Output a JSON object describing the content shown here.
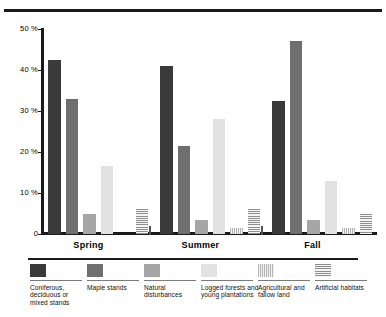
{
  "chart_data": {
    "type": "bar",
    "title": "",
    "xlabel": "",
    "ylabel": "",
    "ylim": [
      0,
      50
    ],
    "ytick_labels": [
      "50 %",
      "40 %",
      "30 %",
      "20 %",
      "10 %",
      "0"
    ],
    "ytick_values": [
      50,
      40,
      30,
      20,
      10,
      0
    ],
    "grid": false,
    "legend_position": "bottom",
    "categories": [
      "Spring",
      "Summer",
      "Fall"
    ],
    "series": [
      {
        "name": "Coniferous, deciduous or mixed stands",
        "fill": "solid-dark",
        "color": "#3a3a3a",
        "values": [
          42.5,
          41.0,
          32.5
        ]
      },
      {
        "name": "Maple stands",
        "fill": "solid-mid",
        "color": "#6f6f6f",
        "values": [
          33.0,
          21.5,
          47.0
        ]
      },
      {
        "name": "Natural disturbances",
        "fill": "solid-grey",
        "color": "#a6a6a6",
        "values": [
          5.0,
          3.5,
          3.5
        ]
      },
      {
        "name": "Logged forests and young plantations",
        "fill": "solid-light",
        "color": "#e2e2e2",
        "values": [
          16.5,
          28.0,
          13.0
        ]
      },
      {
        "name": "Agricultural and fallow land",
        "fill": "vstripe",
        "color": "#b5b5b5",
        "values": [
          0,
          1.5,
          1.5
        ]
      },
      {
        "name": "Artificial habitats",
        "fill": "hstripe",
        "color": "#8f8f8f",
        "values": [
          6.0,
          6.0,
          5.0
        ]
      }
    ]
  },
  "axis": {
    "ticks": [
      {
        "label": "50 %"
      },
      {
        "label": "40 %"
      },
      {
        "label": "30 %"
      },
      {
        "label": "20 %"
      },
      {
        "label": "10 %"
      },
      {
        "label": "0"
      }
    ]
  },
  "groups": [
    {
      "label": "Spring"
    },
    {
      "label": "Summer"
    },
    {
      "label": "Fall"
    }
  ],
  "legend": {
    "items": [
      {
        "label": "Coniferous, deciduous or mixed stands",
        "swatch": "solid-dark"
      },
      {
        "label": "Maple stands",
        "swatch": "solid-mid"
      },
      {
        "label": "Natural disturbances",
        "swatch": "solid-grey"
      },
      {
        "label": "Logged forests and young plantations",
        "swatch": "solid-light"
      },
      {
        "label": "Agricultural and fallow land",
        "swatch": "vstripe"
      },
      {
        "label": "Artificial habitats",
        "swatch": "hstripe"
      }
    ]
  }
}
